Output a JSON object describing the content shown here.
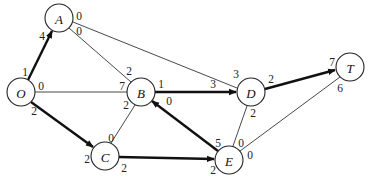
{
  "diagram": {
    "type": "network-flow-graph",
    "nodes": [
      {
        "id": "O",
        "label": "O",
        "x": 21,
        "y": 92
      },
      {
        "id": "A",
        "label": "A",
        "x": 59,
        "y": 18
      },
      {
        "id": "B",
        "label": "B",
        "x": 141,
        "y": 92
      },
      {
        "id": "C",
        "label": "C",
        "x": 105,
        "y": 156
      },
      {
        "id": "D",
        "label": "D",
        "x": 251,
        "y": 92
      },
      {
        "id": "E",
        "label": "E",
        "x": 229,
        "y": 160
      },
      {
        "id": "T",
        "label": "T",
        "x": 350,
        "y": 67
      }
    ],
    "edges": [
      {
        "from": "O",
        "to": "A",
        "bold": true,
        "arrow": true,
        "label_from": "1",
        "label_to": "4"
      },
      {
        "from": "O",
        "to": "B",
        "bold": false,
        "arrow": false,
        "label_from": "0",
        "label_to": "7"
      },
      {
        "from": "O",
        "to": "C",
        "bold": true,
        "arrow": true,
        "label_from": "2",
        "label_to": "2"
      },
      {
        "from": "A",
        "to": "B",
        "bold": false,
        "arrow": false,
        "label_from": "0",
        "label_to": "2"
      },
      {
        "from": "A",
        "to": "D",
        "bold": false,
        "arrow": false,
        "label_from": "0",
        "label_to": "3"
      },
      {
        "from": "B",
        "to": "D",
        "bold": true,
        "arrow": true,
        "label_from": "1",
        "label_to": "3"
      },
      {
        "from": "B",
        "to": "C",
        "bold": false,
        "arrow": false,
        "label_from": "2",
        "label_to": "0"
      },
      {
        "from": "C",
        "to": "E",
        "bold": true,
        "arrow": true,
        "label_from": "2",
        "label_to": "2"
      },
      {
        "from": "E",
        "to": "B",
        "bold": true,
        "arrow": true,
        "label_from": "5",
        "label_to": "0"
      },
      {
        "from": "D",
        "to": "E",
        "bold": false,
        "arrow": false,
        "label_from": "2",
        "label_to": "0"
      },
      {
        "from": "D",
        "to": "T",
        "bold": true,
        "arrow": true,
        "label_from": "2",
        "label_to": "7"
      },
      {
        "from": "E",
        "to": "T",
        "bold": false,
        "arrow": false,
        "label_from": "0",
        "label_to": "6"
      }
    ],
    "labels": {
      "O_A_from": "1",
      "O_A_to": "4",
      "O_B_from": "0",
      "O_B_to": "7",
      "O_C_from": "2",
      "O_C_to": "2",
      "A_B_from": "0",
      "A_B_to": "2",
      "A_D_from": "0",
      "A_D_to": "3",
      "B_D_from": "1",
      "B_D_to": "3",
      "B_C_from": "2",
      "B_C_to": "0",
      "C_E_from": "2",
      "C_E_to": "2",
      "E_B_from": "5",
      "E_B_to": "0",
      "D_E_from": "2",
      "D_E_to": "0",
      "D_T_from": "2",
      "D_T_to": "7",
      "E_T_from": "0",
      "E_T_to": "6"
    },
    "node_labels": {
      "O": "O",
      "A": "A",
      "B": "B",
      "C": "C",
      "D": "D",
      "E": "E",
      "T": "T"
    },
    "colors": {
      "line": "#222222",
      "background": "#ffffff"
    }
  }
}
